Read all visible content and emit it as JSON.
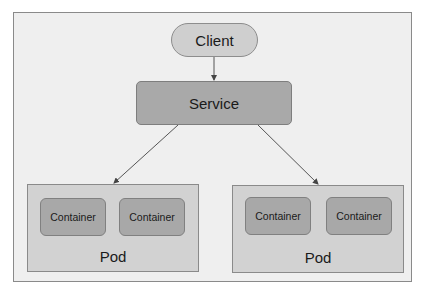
{
  "diagram": {
    "client": {
      "label": "Client"
    },
    "service": {
      "label": "Service"
    },
    "pods": [
      {
        "label": "Pod",
        "containers": [
          {
            "label": "Container"
          },
          {
            "label": "Container"
          }
        ]
      },
      {
        "label": "Pod",
        "containers": [
          {
            "label": "Container"
          },
          {
            "label": "Container"
          }
        ]
      }
    ],
    "edges": [
      {
        "from": "Client",
        "to": "Service"
      },
      {
        "from": "Service",
        "to": "Pod (left)"
      },
      {
        "from": "Service",
        "to": "Pod (right)"
      }
    ],
    "colors": {
      "background": "#efefef",
      "client_fill": "#cfcfcf",
      "service_fill": "#a9a9a9",
      "pod_fill": "#d2d2d2",
      "container_fill": "#a8a8a8",
      "stroke": "#555555"
    }
  }
}
